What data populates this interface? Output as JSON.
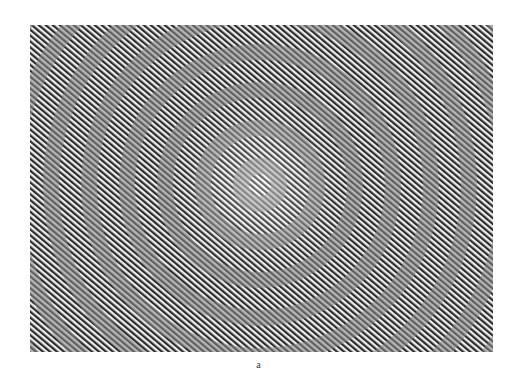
{
  "figure": {
    "caption": "a",
    "pattern": "diagonal-line-grating-with-concentric-ring-moire",
    "center": {
      "x": 230,
      "y": 160
    },
    "line_period_px": 4.5,
    "ring_period_px": 38,
    "colors": {
      "dark": "#1a1a1a",
      "light": "#ffffff",
      "mid": "#8a8a8a"
    }
  }
}
